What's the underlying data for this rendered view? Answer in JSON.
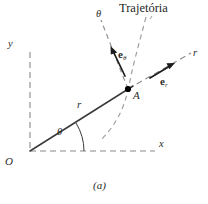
{
  "figure": {
    "caption": "(a)",
    "title": "Trajetória",
    "colors": {
      "ink": "#2b2b2b",
      "dashed_axis": "#8a8a8a",
      "trajectory_dashed": "#9a9a9a",
      "solid_line": "#3a3a3a",
      "point_fill": "#000000",
      "background": "#ffffff"
    },
    "labels": {
      "x_axis": "x",
      "y_axis": "y",
      "r_axis": "r",
      "theta_axis": "θ",
      "r_segment": "r",
      "theta_angle": "θ",
      "origin": "O",
      "point_a": "A",
      "unit_vector_theta_base": "e",
      "unit_vector_theta_sub": "θ",
      "unit_vector_r_base": "e",
      "unit_vector_r_sub": "r"
    },
    "geometry": {
      "origin": [
        30,
        151
      ],
      "point_a": [
        128,
        89
      ],
      "x_axis_end": [
        155,
        151
      ],
      "y_axis_top": [
        30,
        52
      ],
      "r_axis_end": [
        191,
        53
      ],
      "theta_axis_top": [
        102,
        20
      ],
      "angle_theta_degrees": 32
    }
  }
}
